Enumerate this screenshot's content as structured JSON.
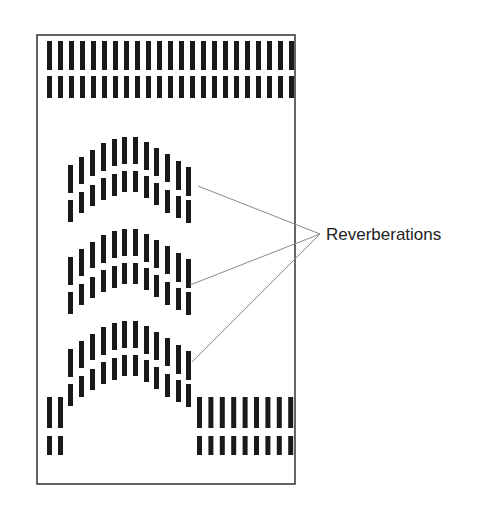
{
  "diagram": {
    "label": "Reverberations",
    "colors": {
      "bar": "#1a1a1a",
      "frame": "#333333",
      "leader": "#8a8a8a",
      "text": "#222222"
    },
    "frame": {
      "x": 37,
      "y": 35,
      "w": 258,
      "h": 449
    },
    "bar_width": 5,
    "top_rows": [
      {
        "count": 23,
        "x0": 47,
        "pitch": 11.0,
        "y": 41,
        "h": 29
      },
      {
        "count": 23,
        "x0": 47,
        "pitch": 11.0,
        "y": 76,
        "h": 22
      }
    ],
    "arc_profile": [
      {
        "x": 68,
        "u0": 165,
        "u1": 193,
        "l0": 200,
        "l1": 222
      },
      {
        "x": 79,
        "u0": 157,
        "u1": 184,
        "l0": 192,
        "l1": 213
      },
      {
        "x": 90,
        "u0": 150,
        "u1": 176,
        "l0": 185,
        "l1": 206
      },
      {
        "x": 101,
        "u0": 143,
        "u1": 171,
        "l0": 178,
        "l1": 200
      },
      {
        "x": 112,
        "u0": 139,
        "u1": 166,
        "l0": 174,
        "l1": 196
      },
      {
        "x": 122,
        "u0": 137,
        "u1": 164,
        "l0": 171,
        "l1": 192
      },
      {
        "x": 133,
        "u0": 137,
        "u1": 164,
        "l0": 171,
        "l1": 192
      },
      {
        "x": 144,
        "u0": 142,
        "u1": 170,
        "l0": 176,
        "l1": 198
      },
      {
        "x": 154,
        "u0": 148,
        "u1": 176,
        "l0": 183,
        "l1": 205
      },
      {
        "x": 165,
        "u0": 154,
        "u1": 182,
        "l0": 190,
        "l1": 213
      },
      {
        "x": 176,
        "u0": 161,
        "u1": 190,
        "l0": 196,
        "l1": 218
      },
      {
        "x": 186,
        "u0": 167,
        "u1": 196,
        "l0": 200,
        "l1": 223
      }
    ],
    "arcs": [
      {
        "name": "reverberation-1",
        "dy": 0
      },
      {
        "name": "reverberation-2",
        "dy": 92
      },
      {
        "name": "reverberation-3",
        "dy": 184
      }
    ],
    "bottom_left": [
      {
        "count": 2,
        "x0": 47,
        "pitch": 11.0,
        "y": 397,
        "h": 31
      },
      {
        "count": 2,
        "x0": 47,
        "pitch": 11.0,
        "y": 436,
        "h": 19
      }
    ],
    "bottom_right": [
      {
        "count": 9,
        "x0": 197,
        "pitch": 11.4,
        "y": 397,
        "h": 31
      },
      {
        "count": 9,
        "x0": 197,
        "pitch": 11.4,
        "y": 436,
        "h": 19
      }
    ],
    "label_anchor": {
      "x": 320,
      "y": 234
    },
    "label_pos": {
      "x": 326,
      "y": 240
    },
    "leaders": [
      {
        "from": [
          198,
          186
        ],
        "to": [
          320,
          234
        ]
      },
      {
        "from": [
          190,
          285
        ],
        "to": [
          320,
          234
        ]
      },
      {
        "from": [
          192,
          362
        ],
        "to": [
          320,
          234
        ]
      }
    ]
  }
}
